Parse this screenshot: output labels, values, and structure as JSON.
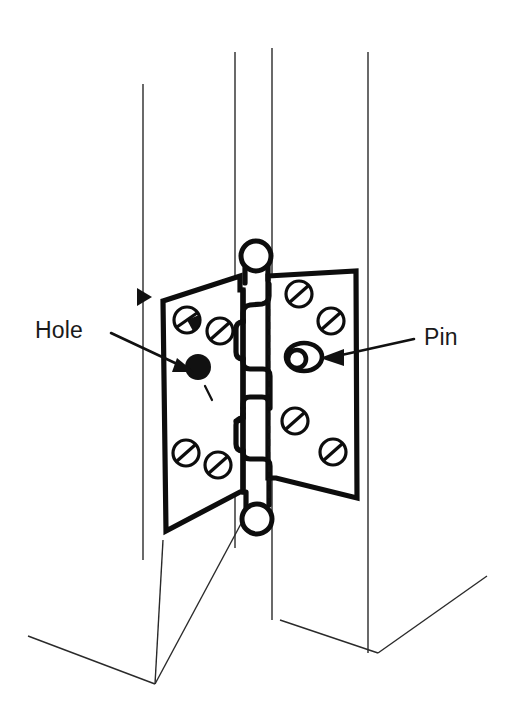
{
  "figure": {
    "type": "technical-line-illustration",
    "ink_color": "#111111",
    "background_color": "#ffffff",
    "labels": [
      {
        "id": "hole",
        "text": "Hole",
        "x": 35,
        "y": 338,
        "points_to": "filled screw hole on left hinge leaf",
        "leader": "line from label to arrowhead at hinge leaf"
      },
      {
        "id": "pin",
        "text": "Pin",
        "x": 424,
        "y": 345,
        "points_to": "hinge pin head on right hinge leaf",
        "leader": "line from label to arrowhead at pin"
      }
    ],
    "callout_count": 2,
    "parts": {
      "left_leaf": {
        "name": "frame leaf",
        "screw_count": 4,
        "has_hole": true
      },
      "right_leaf": {
        "name": "door leaf",
        "screw_count": 4,
        "has_pin": true
      },
      "knuckles": 5,
      "frame_lines": 4
    }
  }
}
